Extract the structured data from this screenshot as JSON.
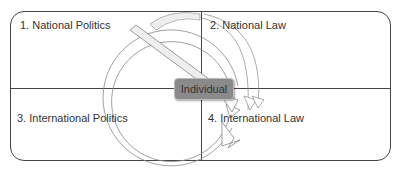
{
  "diagram": {
    "quadrants": [
      {
        "id": 1,
        "label": "1. National Politics",
        "position": "top-left"
      },
      {
        "id": 2,
        "label": "2. National Law",
        "position": "top-right"
      },
      {
        "id": 3,
        "label": "3. International Politics",
        "position": "bottom-left"
      },
      {
        "id": 4,
        "label": "4. International Law",
        "position": "bottom-right"
      }
    ],
    "center": {
      "label": "Individual"
    },
    "arrows": [
      {
        "from": "1. National Politics",
        "to": "4. International Law",
        "style": "diagonal-shaded"
      },
      {
        "from": "1. National Politics",
        "to": "International Law",
        "style": "circular-clockwise"
      }
    ],
    "colors": {
      "border": "#444444",
      "center_box": "#8a8a8a",
      "arrow_fill": "#eeeeee",
      "text": "#333333"
    }
  }
}
